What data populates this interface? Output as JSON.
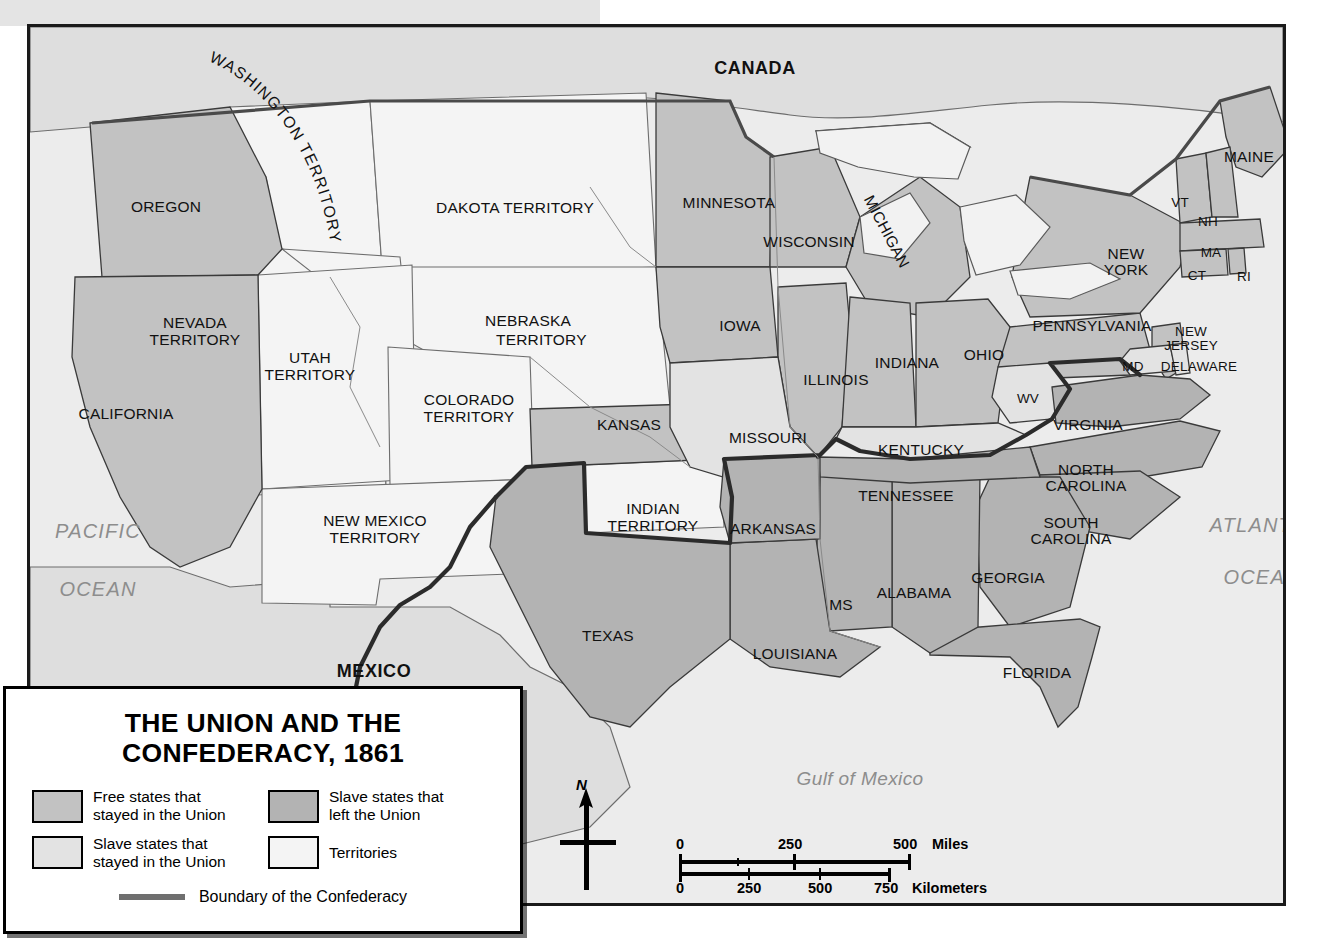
{
  "map": {
    "title": "THE UNION AND THE CONFEDERACY, 1861",
    "title_line1": "THE UNION AND THE",
    "title_line2": "CONFEDERACY, 1861",
    "colors": {
      "free_state": "#c2c2c2",
      "slave_union": "#e3e3e3",
      "confederate": "#b3b3b3",
      "territory": "#f4f4f4",
      "water": "#ededed",
      "canada_mexico": "#dcdcdc",
      "border_line": "#4a4a4a",
      "confederacy_boundary": "#2b2b2b",
      "ocean_label": "#8d8d8d"
    },
    "countries": [
      {
        "name": "CANADA",
        "x": 752,
        "y": 44
      },
      {
        "name": "MEXICO",
        "x": 371,
        "y": 647
      }
    ],
    "oceans": [
      {
        "name_line1": "PACIFIC",
        "name_line2": "OCEAN",
        "x": 95,
        "y": 518
      },
      {
        "name_line1": "ATLANTIC",
        "name_line2": "OCEAN",
        "x": 1260,
        "y": 506
      },
      {
        "name_line1": "Gulf of Mexico",
        "name_line2": "",
        "x": 857,
        "y": 762
      }
    ],
    "regions": [
      {
        "label": "OREGON",
        "category": "free_state",
        "x": 163,
        "y": 180,
        "size": "state"
      },
      {
        "label": "CALIFORNIA",
        "category": "free_state",
        "x": 123,
        "y": 387,
        "size": "state"
      },
      {
        "label": "MINNESOTA",
        "category": "free_state",
        "x": 726,
        "y": 176,
        "size": "state"
      },
      {
        "label": "WISCONSIN",
        "category": "free_state",
        "x": 806,
        "y": 215,
        "size": "state"
      },
      {
        "label": "MICHIGAN",
        "category": "free_state",
        "x": 898,
        "y": 205,
        "size": "state"
      },
      {
        "label": "IOWA",
        "category": "free_state",
        "x": 737,
        "y": 299,
        "size": "state"
      },
      {
        "label": "ILLINOIS",
        "category": "free_state",
        "x": 833,
        "y": 353,
        "size": "state"
      },
      {
        "label": "INDIANA",
        "category": "free_state",
        "x": 904,
        "y": 336,
        "size": "state"
      },
      {
        "label": "OHIO",
        "category": "free_state",
        "x": 981,
        "y": 328,
        "size": "state"
      },
      {
        "label": "KANSAS",
        "category": "free_state",
        "x": 626,
        "y": 398,
        "size": "state"
      },
      {
        "label": "PENNSYLVANIA",
        "category": "free_state",
        "x": 1089,
        "y": 299,
        "size": "state"
      },
      {
        "label": "NEW YORK",
        "category": "free_state",
        "x": 1123,
        "y": 227,
        "size": "state"
      },
      {
        "label": "MAINE",
        "category": "free_state",
        "x": 1246,
        "y": 130,
        "size": "state"
      },
      {
        "label": "VT",
        "category": "free_state",
        "x": 1177,
        "y": 177,
        "size": "small"
      },
      {
        "label": "NH",
        "category": "free_state",
        "x": 1205,
        "y": 196,
        "size": "small"
      },
      {
        "label": "MA",
        "category": "free_state",
        "x": 1208,
        "y": 227,
        "size": "small"
      },
      {
        "label": "CT",
        "category": "free_state",
        "x": 1194,
        "y": 250,
        "size": "small"
      },
      {
        "label": "RI",
        "category": "free_state",
        "x": 1241,
        "y": 251,
        "size": "small"
      },
      {
        "label": "NEW JERSEY",
        "category": "free_state",
        "x": 1188,
        "y": 306,
        "size": "small"
      },
      {
        "label": "MISSOURI",
        "category": "slave_union",
        "x": 765,
        "y": 411,
        "size": "state"
      },
      {
        "label": "KENTUCKY",
        "category": "slave_union",
        "x": 918,
        "y": 423,
        "size": "state"
      },
      {
        "label": "DELAWARE",
        "category": "slave_union",
        "x": 1196,
        "y": 341,
        "size": "small"
      },
      {
        "label": "MD",
        "category": "slave_union",
        "x": 1130,
        "y": 341,
        "size": "small"
      },
      {
        "label": "WV",
        "category": "slave_union",
        "x": 1025,
        "y": 373,
        "size": "small"
      },
      {
        "label": "VIRGINIA",
        "category": "confederate",
        "x": 1085,
        "y": 398,
        "size": "state"
      },
      {
        "label": "NORTH CAROLINA",
        "category": "confederate",
        "x": 1083,
        "y": 443,
        "size": "state"
      },
      {
        "label": "SOUTH CAROLINA",
        "category": "confederate",
        "x": 1068,
        "y": 496,
        "size": "state"
      },
      {
        "label": "GEORGIA",
        "category": "confederate",
        "x": 1005,
        "y": 551,
        "size": "state"
      },
      {
        "label": "FLORIDA",
        "category": "confederate",
        "x": 1034,
        "y": 646,
        "size": "state"
      },
      {
        "label": "ALABAMA",
        "category": "confederate",
        "x": 911,
        "y": 566,
        "size": "state"
      },
      {
        "label": "MS",
        "category": "confederate",
        "x": 838,
        "y": 578,
        "size": "state"
      },
      {
        "label": "LOUISIANA",
        "category": "confederate",
        "x": 792,
        "y": 627,
        "size": "state"
      },
      {
        "label": "TENNESSEE",
        "category": "confederate",
        "x": 903,
        "y": 469,
        "size": "state"
      },
      {
        "label": "ARKANSAS",
        "category": "confederate",
        "x": 770,
        "y": 502,
        "size": "state"
      },
      {
        "label": "TEXAS",
        "category": "confederate",
        "x": 605,
        "y": 609,
        "size": "state"
      },
      {
        "label": "WASHINGTON TERRITORY",
        "category": "territory",
        "x": 250,
        "y": 150,
        "size": "state"
      },
      {
        "label": "DAKOTA TERRITORY",
        "category": "territory",
        "x": 511,
        "y": 181,
        "size": "state"
      },
      {
        "label": "NEBRASKA TERRITORY",
        "category": "territory",
        "x": 555,
        "y": 302,
        "size": "state"
      },
      {
        "label": "NEVADA TERRITORY",
        "category": "territory",
        "x": 192,
        "y": 295,
        "size": "state"
      },
      {
        "label": "UTAH TERRITORY",
        "category": "territory",
        "x": 307,
        "y": 330,
        "size": "state"
      },
      {
        "label": "COLORADO TERRITORY",
        "category": "territory",
        "x": 466,
        "y": 372,
        "size": "state"
      },
      {
        "label": "NEW MEXICO TERRITORY",
        "category": "territory",
        "x": 372,
        "y": 493,
        "size": "state"
      },
      {
        "label": "INDIAN TERRITORY",
        "category": "territory",
        "x": 650,
        "y": 481,
        "size": "state"
      }
    ]
  },
  "legend": {
    "items": [
      {
        "label_line1": "Free states that",
        "label_line2": "stayed in the Union",
        "swatch": "#c2c2c2",
        "name": "free-states-union"
      },
      {
        "label_line1": "Slave states that",
        "label_line2": "left the Union",
        "swatch": "#b3b3b3",
        "name": "slave-states-left"
      },
      {
        "label_line1": "Slave states that",
        "label_line2": "stayed in the Union",
        "swatch": "#e3e3e3",
        "name": "slave-states-stayed"
      },
      {
        "label_line1": "Territories",
        "label_line2": "",
        "swatch": "#f4f4f4",
        "name": "territories"
      }
    ],
    "boundary_label": "Boundary of the Confederacy",
    "boundary_color": "#6f6f6f"
  },
  "compass": {
    "north_label": "N"
  },
  "scale": {
    "miles": {
      "unit": "Miles",
      "ticks": [
        "0",
        "250",
        "500"
      ]
    },
    "kilometers": {
      "unit": "Kilometers",
      "ticks": [
        "0",
        "250",
        "500",
        "750"
      ]
    }
  }
}
